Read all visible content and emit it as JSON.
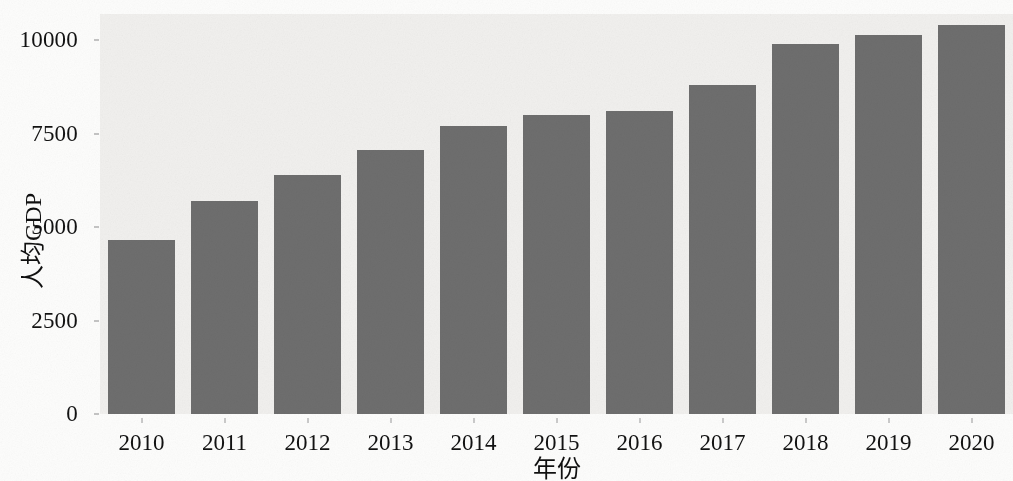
{
  "chart_data": {
    "type": "bar",
    "title": "",
    "subtitle": "",
    "xlabel": "年份",
    "ylabel": "人均GDP",
    "categories": [
      "2010",
      "2011",
      "2012",
      "2013",
      "2014",
      "2015",
      "2016",
      "2017",
      "2018",
      "2019",
      "2020"
    ],
    "values": [
      4650,
      5700,
      6400,
      7050,
      7700,
      8000,
      8100,
      8800,
      9900,
      10150,
      10400
    ],
    "series": [
      {
        "name": "人均GDP",
        "values": [
          4650,
          5700,
          6400,
          7050,
          7700,
          8000,
          8100,
          8800,
          9900,
          10150,
          10400
        ]
      }
    ],
    "ylim": [
      0,
      10700
    ],
    "yticks": [
      0,
      2500,
      5000,
      7500,
      10000
    ],
    "ytick_labels": [
      "0",
      "2500",
      "5000",
      "7500",
      "10000"
    ],
    "xtick_labels": [
      "2010",
      "2011",
      "2012",
      "2013",
      "2014",
      "2015",
      "2016",
      "2017",
      "2018",
      "2019",
      "2020"
    ],
    "grid": false,
    "legend": "none",
    "bar_color": "#6e6e6e",
    "panel_background": "#f1f0ee",
    "figure_background": "#fdfdfc",
    "axis_text_color": "#121212"
  }
}
